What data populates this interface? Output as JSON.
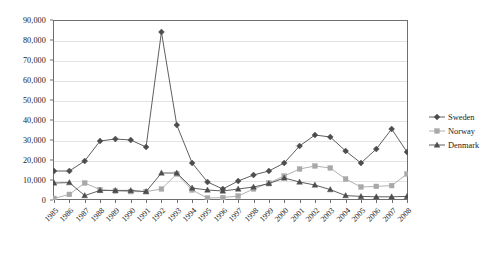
{
  "chart_data": {
    "type": "line",
    "title": "",
    "xlabel": "",
    "ylabel": "",
    "ylim": [
      0,
      90000
    ],
    "yticks": [
      "0",
      "10,000",
      "20,000",
      "30,000",
      "40,000",
      "50,000",
      "60,000",
      "70,000",
      "80,000",
      "90,000"
    ],
    "ytick_values": [
      0,
      10000,
      20000,
      30000,
      40000,
      50000,
      60000,
      70000,
      80000,
      90000
    ],
    "grid": true,
    "legend_position": "right",
    "categories": [
      "1985",
      "1986",
      "1987",
      "1988",
      "1989",
      "1990",
      "1991",
      "1992",
      "1993",
      "1994",
      "1995",
      "1996",
      "1997",
      "1998",
      "1999",
      "2000",
      "2001",
      "2002",
      "2003",
      "2004",
      "2005",
      "2006",
      "2007",
      "2008"
    ],
    "series": [
      {
        "name": "Sweden",
        "marker": "diamond",
        "color": "#4d4d4d",
        "values": [
          14500,
          14500,
          19500,
          29500,
          30500,
          30000,
          26500,
          84000,
          37500,
          18500,
          9000,
          5500,
          9500,
          12500,
          14500,
          18500,
          27000,
          32500,
          31500,
          24500,
          18500,
          25500,
          35500,
          24000
        ]
      },
      {
        "name": "Norway",
        "marker": "square",
        "color": "#a8a8a8",
        "values": [
          800,
          2800,
          8500,
          5200,
          4500,
          4200,
          4200,
          5500,
          13000,
          5000,
          1000,
          1200,
          2000,
          5500,
          8500,
          12000,
          15500,
          17000,
          16000,
          10500,
          6500,
          6800,
          7200,
          13000
        ]
      },
      {
        "name": "Denmark",
        "marker": "triangle",
        "color": "#4d4d4d",
        "values": [
          8500,
          8700,
          2200,
          4800,
          4800,
          4800,
          4200,
          13500,
          13500,
          6000,
          5000,
          4500,
          5500,
          6500,
          8200,
          11000,
          9000,
          7500,
          5200,
          2200,
          1800,
          1600,
          1600,
          1800
        ]
      }
    ]
  },
  "legend": {
    "items": [
      {
        "label": "Sweden"
      },
      {
        "label": "Norway"
      },
      {
        "label": "Denmark"
      }
    ]
  }
}
